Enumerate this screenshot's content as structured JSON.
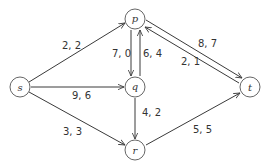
{
  "diagram": {
    "title": "",
    "type": "flow network",
    "nodes": [
      {
        "id": "s",
        "label": "s",
        "x": 20,
        "y": 87
      },
      {
        "id": "p",
        "label": "p",
        "x": 135,
        "y": 19
      },
      {
        "id": "q",
        "label": "q",
        "x": 135,
        "y": 87
      },
      {
        "id": "r",
        "label": "r",
        "x": 135,
        "y": 150
      },
      {
        "id": "t",
        "label": "t",
        "x": 250,
        "y": 87
      }
    ],
    "edges": [
      {
        "from": "s",
        "to": "p",
        "label": "2, 2"
      },
      {
        "from": "s",
        "to": "q",
        "label": "9, 6"
      },
      {
        "from": "s",
        "to": "r",
        "label": "3, 3"
      },
      {
        "from": "p",
        "to": "q",
        "label": "7, 0"
      },
      {
        "from": "q",
        "to": "p",
        "label": "6, 4"
      },
      {
        "from": "p",
        "to": "t",
        "label": "8, 7"
      },
      {
        "from": "t",
        "to": "p",
        "label": "2, 1"
      },
      {
        "from": "q",
        "to": "r",
        "label": "4, 2"
      },
      {
        "from": "r",
        "to": "t",
        "label": "5, 5"
      }
    ]
  }
}
